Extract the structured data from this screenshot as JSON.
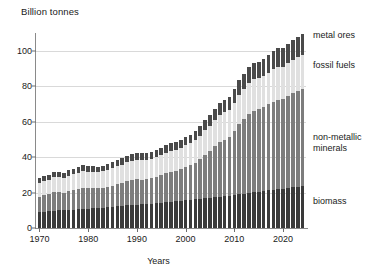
{
  "chart_data": {
    "type": "bar",
    "stacked": true,
    "title": "Billion tonnes",
    "xlabel": "Years",
    "ylabel": "Billion tonnes",
    "ylim": [
      0,
      110
    ],
    "yticks": [
      0,
      20,
      40,
      60,
      80,
      100
    ],
    "xticks": [
      1970,
      1980,
      1990,
      2000,
      2010,
      2020
    ],
    "xlim": [
      1969.3,
      2024.7
    ],
    "grid": true,
    "legend_position": "right",
    "colors": {
      "biomass": "#3a3a3a",
      "non_metallic_minerals": "#7d7d7d",
      "fossil_fuels": "#e0e0e0",
      "metal_ores": "#4a4a4a",
      "gridline": "#d9d9d9",
      "axis": "#8a8a8a",
      "background": "#ffffff"
    },
    "categories": [
      1970,
      1971,
      1972,
      1973,
      1974,
      1975,
      1976,
      1977,
      1978,
      1979,
      1980,
      1981,
      1982,
      1983,
      1984,
      1985,
      1986,
      1987,
      1988,
      1989,
      1990,
      1991,
      1992,
      1993,
      1994,
      1995,
      1996,
      1997,
      1998,
      1999,
      2000,
      2001,
      2002,
      2003,
      2004,
      2005,
      2006,
      2007,
      2008,
      2009,
      2010,
      2011,
      2012,
      2013,
      2014,
      2015,
      2016,
      2017,
      2018,
      2019,
      2020,
      2021,
      2022,
      2023,
      2024
    ],
    "series": [
      {
        "name": "biomass",
        "label": "biomass",
        "color": "#3a3a3a",
        "values": [
          9.1,
          9.3,
          9.4,
          9.7,
          9.9,
          10.0,
          10.2,
          10.4,
          10.7,
          10.9,
          11.0,
          11.2,
          11.4,
          11.5,
          11.8,
          12.0,
          12.3,
          12.5,
          12.8,
          13.0,
          13.2,
          13.3,
          13.5,
          13.7,
          14.0,
          14.3,
          14.6,
          14.8,
          15.0,
          15.3,
          15.6,
          15.8,
          16.1,
          16.4,
          16.8,
          17.1,
          17.4,
          17.7,
          18.0,
          18.2,
          18.6,
          19.0,
          19.4,
          19.8,
          20.2,
          20.5,
          20.9,
          21.3,
          21.7,
          22.0,
          22.2,
          22.6,
          23.0,
          23.4,
          23.7
        ]
      },
      {
        "name": "non_metallic_minerals",
        "label": "non-metallic minerals",
        "color": "#7d7d7d",
        "values": [
          8.6,
          9.2,
          9.7,
          10.4,
          10.2,
          9.9,
          10.5,
          10.9,
          11.4,
          11.7,
          11.4,
          11.2,
          11.0,
          11.3,
          11.6,
          11.9,
          12.4,
          12.9,
          13.5,
          14.0,
          14.2,
          14.0,
          14.1,
          14.4,
          15.0,
          15.6,
          16.2,
          16.9,
          17.4,
          18.1,
          18.9,
          19.6,
          20.8,
          22.6,
          24.6,
          26.5,
          28.6,
          30.7,
          31.8,
          33.2,
          36.0,
          39.5,
          42.0,
          44.5,
          46.0,
          46.5,
          47.5,
          48.5,
          49.5,
          50.5,
          50.8,
          52.0,
          53.0,
          54.0,
          54.8
        ]
      },
      {
        "name": "fossil_fuels",
        "label": "fossil fuels",
        "color": "#e0e0e0",
        "values": [
          7.6,
          7.9,
          8.2,
          8.6,
          8.5,
          8.4,
          8.8,
          9.0,
          9.2,
          9.5,
          9.4,
          9.2,
          9.1,
          9.2,
          9.6,
          9.9,
          10.1,
          10.4,
          10.7,
          11.0,
          11.1,
          11.0,
          10.9,
          10.9,
          11.0,
          11.2,
          11.5,
          11.7,
          11.7,
          11.8,
          12.1,
          12.3,
          12.5,
          13.0,
          13.7,
          14.2,
          14.7,
          15.2,
          15.5,
          15.3,
          16.0,
          16.7,
          17.0,
          17.4,
          17.6,
          17.5,
          17.6,
          17.9,
          18.3,
          18.5,
          17.9,
          18.6,
          19.0,
          19.2,
          19.4
        ]
      },
      {
        "name": "metal_ores",
        "label": "metal ores",
        "color": "#4a4a4a",
        "values": [
          2.7,
          2.8,
          2.9,
          3.1,
          3.1,
          3.0,
          3.2,
          3.2,
          3.3,
          3.4,
          3.4,
          3.3,
          3.2,
          3.2,
          3.4,
          3.5,
          3.6,
          3.7,
          3.9,
          4.0,
          4.0,
          3.9,
          3.9,
          4.0,
          4.1,
          4.2,
          4.4,
          4.5,
          4.6,
          4.7,
          4.9,
          5.0,
          5.2,
          5.5,
          5.9,
          6.2,
          6.6,
          7.0,
          7.2,
          7.3,
          7.9,
          8.4,
          8.7,
          9.0,
          9.3,
          9.4,
          9.6,
          9.9,
          10.1,
          10.3,
          10.4,
          10.7,
          11.0,
          11.3,
          11.5
        ]
      }
    ],
    "legend": [
      {
        "name": "metal-ores",
        "label": "metal ores",
        "top": 30
      },
      {
        "name": "fossil-fuels",
        "label": "fossil fuels",
        "top": 60
      },
      {
        "name": "non-metallic-minerals",
        "label": "non-metallic",
        "top": 132
      },
      {
        "name": "non-metallic-minerals-2",
        "label": "minerals",
        "top": 143
      },
      {
        "name": "biomass",
        "label": "biomass",
        "top": 196
      }
    ]
  }
}
